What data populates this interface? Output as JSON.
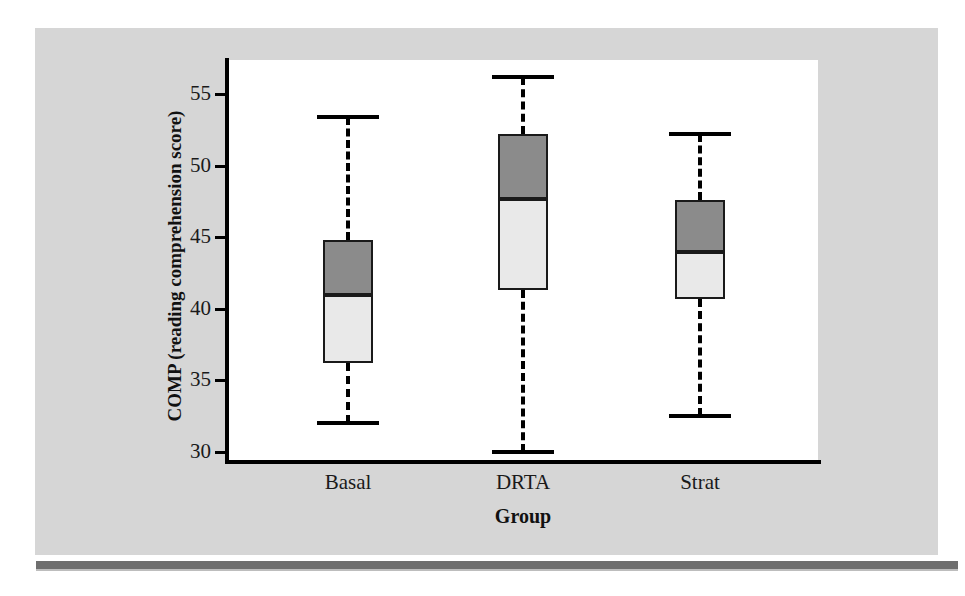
{
  "figure": {
    "background_color": "#d6d6d6",
    "plot_background_color": "#ffffff",
    "rule_color": "#6e6e6e"
  },
  "chart_data": {
    "type": "box",
    "title": "",
    "xlabel": "Group",
    "ylabel": "COMP (reading comprehension score)",
    "categories": [
      "Basal",
      "DRTA",
      "Strat"
    ],
    "ylim": [
      29.0,
      57.3
    ],
    "yticks": [
      30,
      35,
      40,
      45,
      50,
      55
    ],
    "ytick_labels": [
      "30",
      "35",
      "40",
      "45",
      "50",
      "55"
    ],
    "grid": false,
    "legend": "none",
    "series": [
      {
        "name": "Basal",
        "whisker_low": 32.0,
        "q1": 36.2,
        "median": 41.0,
        "q3": 44.8,
        "whisker_high": 53.4
      },
      {
        "name": "DRTA",
        "whisker_low": 30.0,
        "q1": 41.3,
        "median": 47.7,
        "q3": 52.2,
        "whisker_high": 56.2
      },
      {
        "name": "Strat",
        "whisker_low": 32.5,
        "q1": 40.7,
        "median": 44.0,
        "q3": 47.6,
        "whisker_high": 52.2
      }
    ],
    "box_colors": {
      "upper_half": "#8b8b8b",
      "lower_half": "#e9e9e9",
      "outline": "#1a1a1a"
    }
  }
}
